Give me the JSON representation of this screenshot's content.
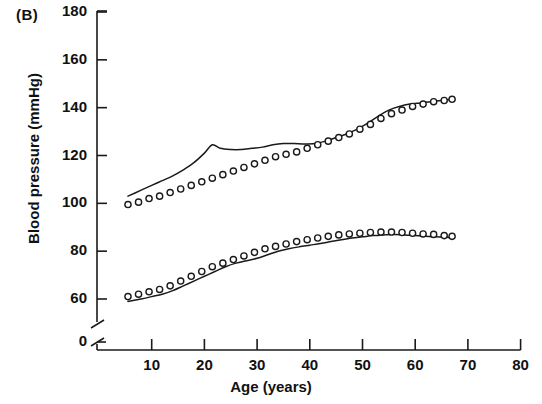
{
  "panel": {
    "label": "(B)"
  },
  "chart_data": {
    "type": "line",
    "title": "",
    "xlabel": "Age (years)",
    "ylabel": "Blood pressure (mmHg)",
    "xlim": [
      0,
      80
    ],
    "ylim": [
      0,
      180
    ],
    "y_axis_break": true,
    "y_break_between": [
      0,
      50
    ],
    "grid": false,
    "legend": "none",
    "xticks": [
      0,
      10,
      20,
      30,
      40,
      50,
      60,
      70,
      80
    ],
    "xtick_labels": [
      "0",
      "10",
      "20",
      "30",
      "40",
      "50",
      "60",
      "70",
      "80"
    ],
    "yticks": [
      0,
      60,
      80,
      100,
      120,
      140,
      160,
      180
    ],
    "ytick_labels": [
      "0",
      "60",
      "80",
      "100",
      "120",
      "140",
      "160",
      "180"
    ],
    "series": [
      {
        "name": "Systolic line",
        "marker": "none",
        "style": "solid",
        "color": "#1a1a1a",
        "x": [
          5.5,
          8,
          10,
          12,
          14,
          16,
          18,
          20,
          21.5,
          23,
          25,
          27,
          29,
          31,
          33,
          35,
          37,
          39,
          41,
          43,
          45,
          47,
          49,
          51,
          53,
          55,
          57,
          59,
          61,
          63,
          65,
          67
        ],
        "y": [
          103.0,
          105.5,
          107.5,
          109.5,
          111.5,
          114.0,
          117.0,
          121.0,
          124.5,
          123.0,
          122.5,
          122.5,
          123.0,
          123.5,
          124.5,
          125.0,
          125.0,
          124.8,
          125.0,
          126.0,
          127.5,
          129.0,
          131.0,
          133.5,
          136.5,
          139.0,
          140.5,
          141.5,
          142.0,
          142.5,
          143.0,
          143.5
        ]
      },
      {
        "name": "Systolic circles",
        "marker": "o",
        "style": "markers",
        "color": "#1a1a1a",
        "x": [
          5.5,
          7.5,
          9.5,
          11.5,
          13.5,
          15.5,
          17.5,
          19.5,
          21.5,
          23.5,
          25.5,
          27.5,
          29.5,
          31.5,
          33.5,
          35.5,
          37.5,
          39.5,
          41.5,
          43.5,
          45.5,
          47.5,
          49.5,
          51.5,
          53.5,
          55.5,
          57.5,
          59.5,
          61.5,
          63.5,
          65.5,
          67
        ],
        "y": [
          99.5,
          100.5,
          102.0,
          103.0,
          104.5,
          106.0,
          107.5,
          109.0,
          110.5,
          112.0,
          113.5,
          115.0,
          116.5,
          118.0,
          119.5,
          120.5,
          121.5,
          123.0,
          124.5,
          126.0,
          127.5,
          129.0,
          131.0,
          133.0,
          135.5,
          137.5,
          139.0,
          140.5,
          141.5,
          142.5,
          143.0,
          143.5
        ]
      },
      {
        "name": "Diastolic line",
        "marker": "none",
        "style": "solid",
        "color": "#1a1a1a",
        "x": [
          5.5,
          8,
          10,
          12,
          14,
          16,
          18,
          20,
          22,
          24,
          26,
          28,
          30,
          32,
          34,
          36,
          38,
          40,
          42,
          44,
          46,
          48,
          50,
          52,
          54,
          56,
          58,
          60,
          62,
          64,
          66,
          67
        ],
        "y": [
          59.0,
          60.0,
          61.0,
          62.0,
          63.5,
          65.5,
          67.5,
          69.5,
          71.5,
          73.5,
          75.0,
          76.0,
          77.0,
          78.5,
          80.0,
          81.0,
          81.8,
          82.5,
          83.2,
          84.0,
          84.8,
          85.5,
          86.0,
          86.5,
          86.8,
          87.0,
          86.8,
          86.5,
          86.2,
          86.0,
          85.8,
          85.5
        ]
      },
      {
        "name": "Diastolic circles",
        "marker": "o",
        "style": "markers",
        "color": "#1a1a1a",
        "x": [
          5.5,
          7.5,
          9.5,
          11.5,
          13.5,
          15.5,
          17.5,
          19.5,
          21.5,
          23.5,
          25.5,
          27.5,
          29.5,
          31.5,
          33.5,
          35.5,
          37.5,
          39.5,
          41.5,
          43.5,
          45.5,
          47.5,
          49.5,
          51.5,
          53.5,
          55.5,
          57.5,
          59.5,
          61.5,
          63.5,
          65.5,
          67
        ],
        "y": [
          61.0,
          62.0,
          63.0,
          64.0,
          65.5,
          67.5,
          69.5,
          71.5,
          73.5,
          75.0,
          76.5,
          78.0,
          79.5,
          81.0,
          82.0,
          83.0,
          84.0,
          84.8,
          85.5,
          86.2,
          86.8,
          87.2,
          87.5,
          87.8,
          88.0,
          88.0,
          87.8,
          87.5,
          87.2,
          87.0,
          86.5,
          86.2
        ]
      }
    ]
  }
}
